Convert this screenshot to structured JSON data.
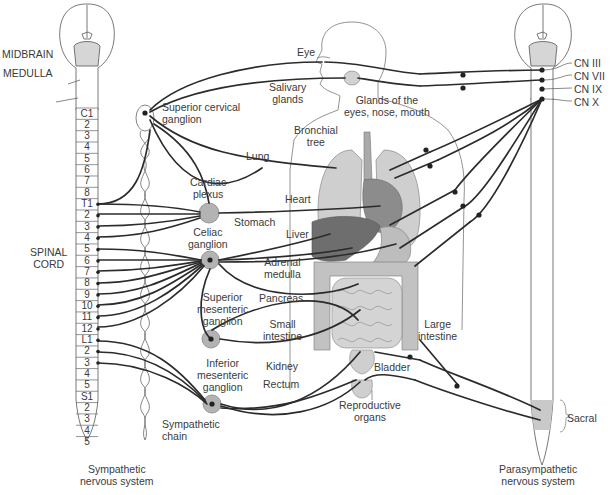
{
  "diagram": {
    "left_brain_labels": {
      "midbrain": "MIDBRAIN",
      "medulla": "MEDULLA"
    },
    "spinal_cord_label": [
      "SPINAL",
      "CORD"
    ],
    "segments": [
      "C1",
      "2",
      "3",
      "4",
      "5",
      "6",
      "7",
      "8",
      "T1",
      "2",
      "3",
      "4",
      "5",
      "6",
      "7",
      "8",
      "9",
      "10",
      "11",
      "12",
      "L1",
      "2",
      "3",
      "4",
      "5",
      "S1",
      "2",
      "3",
      "4",
      "5"
    ],
    "ganglia": {
      "superior_cervical": [
        "Superior cervical",
        "ganglion"
      ],
      "cardiac_plexus": [
        "Cardiac",
        "plexus"
      ],
      "celiac": [
        "Celiac",
        "ganglion"
      ],
      "superior_mesenteric": [
        "Superior",
        "mesenteric",
        "ganglion"
      ],
      "inferior_mesenteric": [
        "Inferior",
        "mesenteric",
        "ganglion"
      ]
    },
    "organs": {
      "eye": "Eye",
      "salivary": [
        "Salivary",
        "glands"
      ],
      "glands_eyes": [
        "Glands of the",
        "eyes, nose, mouth"
      ],
      "bronchial": [
        "Bronchial",
        "tree"
      ],
      "lung": "Lung",
      "heart": "Heart",
      "stomach": "Stomach",
      "liver": "Liver",
      "adrenal": [
        "Adrenal",
        "medulla"
      ],
      "pancreas": "Pancreas",
      "small_intestine": [
        "Small",
        "intestine"
      ],
      "kidney": "Kidney",
      "rectum": "Rectum",
      "large_intestine": [
        "Large",
        "intestine"
      ],
      "bladder": "Bladder",
      "reproductive": [
        "Reproductive",
        "organs"
      ]
    },
    "cranial_nerves": [
      "CN III",
      "CN VII",
      "CN IX",
      "CN X"
    ],
    "sacral": "Sacral",
    "sympathetic_chain": [
      "Sympathetic",
      "chain"
    ],
    "captions": {
      "sympathetic": [
        "Sympathetic",
        "nervous system"
      ],
      "parasympathetic": [
        "Parasympathetic",
        "nervous system"
      ]
    },
    "colors": {
      "line": "#2b2b2b",
      "organ_light": "#c8c8c8",
      "organ_dark": "#6e6e6e",
      "ganglion": "#b3b3b3",
      "sacral_fill": "#c9c9c9"
    }
  }
}
